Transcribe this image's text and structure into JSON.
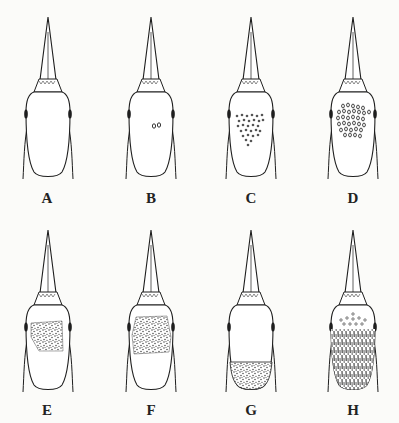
{
  "figure": {
    "type": "bird-head-dorsal-view-series",
    "panels": [
      {
        "label": "A",
        "pattern": "none"
      },
      {
        "label": "B",
        "pattern": "spots",
        "spot_count": 2
      },
      {
        "label": "C",
        "pattern": "spots",
        "spot_count": 30
      },
      {
        "label": "D",
        "pattern": "spots",
        "spot_count": 40
      },
      {
        "label": "E",
        "pattern": "stipple-patch-center"
      },
      {
        "label": "F",
        "pattern": "stipple-patch-large"
      },
      {
        "label": "G",
        "pattern": "stipple-rear"
      },
      {
        "label": "H",
        "pattern": "streaked-full"
      }
    ],
    "ink_color": "#1e1e1e",
    "paper_color": "#fbfbf9"
  }
}
